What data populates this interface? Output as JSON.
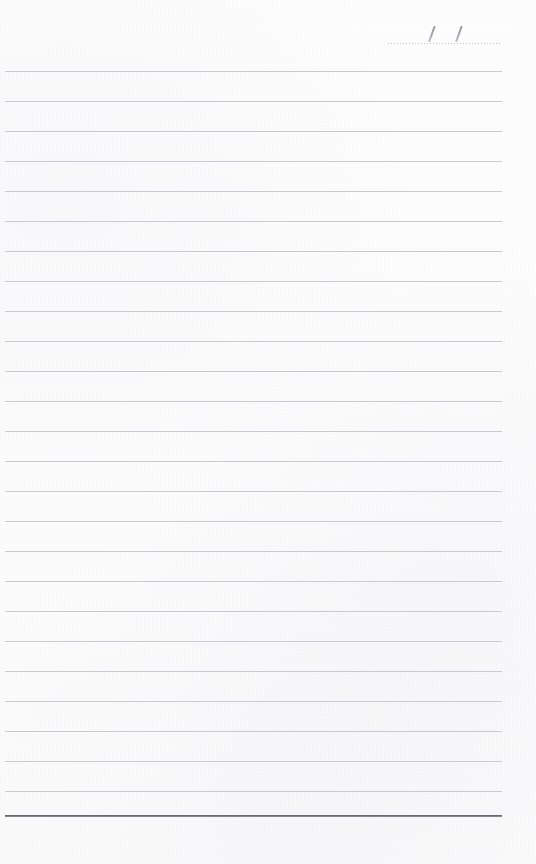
{
  "page": {
    "kind": "ruled-notebook-page",
    "width": 536,
    "height": 864,
    "background_color": "#fdfdfd",
    "paper_tone": "scanned off-white"
  },
  "date_field": {
    "name": "date-line",
    "value": "",
    "placeholder": "",
    "separator_marks": [
      "/",
      "/"
    ],
    "rule_style": "dotted",
    "rule_color": "#b9b9c0",
    "mark_color": "#8c8c94",
    "left_px": 388,
    "top_px": 18,
    "width_px": 114
  },
  "ruled_lines": {
    "name": "writing-lines",
    "count": 25,
    "first_line_y": 71,
    "spacing_px": 30,
    "left_px": 5,
    "width_px": 497,
    "color": "#c6c6cc",
    "thickness_px": 1,
    "y_positions": [
      71,
      101,
      131,
      161,
      191,
      221,
      251,
      281,
      311,
      341,
      371,
      401,
      431,
      461,
      491,
      521,
      551,
      581,
      611,
      641,
      671,
      701,
      731,
      761,
      791
    ]
  },
  "bottom_rule": {
    "name": "bottom-border-line",
    "y": 815,
    "color": "#6e6e76",
    "thickness_px": 2,
    "left_px": 5,
    "width_px": 497
  },
  "footer_area": {
    "name": "footer-margin",
    "top_px": 818,
    "height_px": 46,
    "content": ""
  }
}
